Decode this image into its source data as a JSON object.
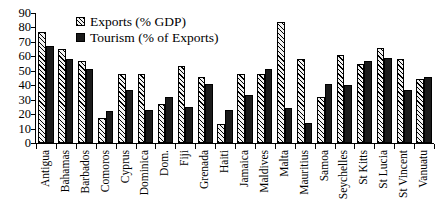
{
  "chart_data": {
    "type": "bar",
    "title": "",
    "subtitle": "",
    "xlabel": "",
    "ylabel": "",
    "ylim": [
      0,
      90
    ],
    "yticks": [
      0,
      10,
      20,
      30,
      40,
      50,
      60,
      70,
      80,
      90
    ],
    "grid": false,
    "legend_position": "top-left-inside",
    "categories": [
      "Antigua",
      "Bahamas",
      "Barbados",
      "Comoros",
      "Cyprus",
      "Dominica",
      "Dom.",
      "Fiji",
      "Grenada",
      "Haiti",
      "Jamaica",
      "Maldives",
      "Malta",
      "Mauritius",
      "Samoa",
      "Seychelles",
      "St Kitts",
      "St Lucia",
      "St Vincent",
      "Vanuatu"
    ],
    "series": [
      {
        "name": "Exports (% GDP)",
        "color": "#f2f2f2",
        "pattern": "diagonal-hatch",
        "values": [
          77,
          65,
          57,
          17,
          48,
          48,
          27,
          53,
          46,
          13,
          48,
          48,
          84,
          58,
          32,
          61,
          55,
          66,
          58,
          44
        ]
      },
      {
        "name": "Tourism (% of Exports)",
        "color": "#1a1a1a",
        "pattern": "solid",
        "values": [
          67,
          58,
          51,
          22,
          37,
          23,
          32,
          25,
          41,
          23,
          33,
          51,
          24,
          14,
          41,
          40,
          57,
          59,
          37,
          46
        ]
      }
    ]
  },
  "legend": {
    "items": [
      {
        "label": "Exports (% GDP)",
        "swatch": "hatched-swatch-icon"
      },
      {
        "label": "Tourism (% of Exports)",
        "swatch": "solid-swatch-icon"
      }
    ]
  }
}
